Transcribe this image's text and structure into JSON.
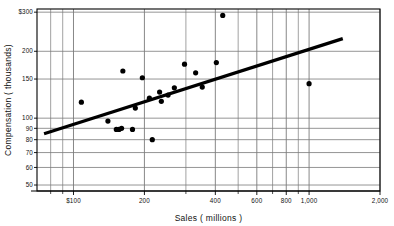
{
  "chart_data": {
    "type": "scatter",
    "title": "",
    "xlabel": "Sales ( millions )",
    "ylabel": "Compensation ( thousands)",
    "xscale": "log",
    "yscale": "log",
    "xlim": [
      70,
      2000
    ],
    "ylim": [
      47,
      310
    ],
    "grid": true,
    "legend": "none",
    "x_ticks": [
      {
        "value": 100,
        "label": "$100",
        "major": true
      },
      {
        "value": 200,
        "label": "200",
        "major": true
      },
      {
        "value": 400,
        "label": "400",
        "major": true
      },
      {
        "value": 600,
        "label": "600",
        "major": true
      },
      {
        "value": 800,
        "label": "800",
        "major": true
      },
      {
        "value": 1000,
        "label": "1,000",
        "major": true
      },
      {
        "value": 2000,
        "label": "2,000",
        "major": true
      }
    ],
    "x_minor_ticks": [
      80,
      90,
      300,
      500,
      700,
      900
    ],
    "y_ticks": [
      {
        "value": 300,
        "label": "$300"
      },
      {
        "value": 200,
        "label": "200"
      },
      {
        "value": 150,
        "label": "150"
      },
      {
        "value": 100,
        "label": "100"
      },
      {
        "value": 90,
        "label": "90"
      },
      {
        "value": 80,
        "label": "80"
      },
      {
        "value": 70,
        "label": "70"
      },
      {
        "value": 60,
        "label": "60"
      },
      {
        "value": 50,
        "label": "50"
      }
    ],
    "points": [
      {
        "x": 108,
        "y": 118
      },
      {
        "x": 162,
        "y": 163
      },
      {
        "x": 196,
        "y": 152
      },
      {
        "x": 140,
        "y": 97
      },
      {
        "x": 152,
        "y": 89
      },
      {
        "x": 156,
        "y": 89
      },
      {
        "x": 160,
        "y": 90
      },
      {
        "x": 178,
        "y": 89
      },
      {
        "x": 183,
        "y": 111
      },
      {
        "x": 216,
        "y": 80
      },
      {
        "x": 210,
        "y": 123
      },
      {
        "x": 232,
        "y": 131
      },
      {
        "x": 236,
        "y": 119
      },
      {
        "x": 252,
        "y": 127
      },
      {
        "x": 268,
        "y": 137
      },
      {
        "x": 296,
        "y": 175
      },
      {
        "x": 330,
        "y": 160
      },
      {
        "x": 352,
        "y": 138
      },
      {
        "x": 404,
        "y": 178
      },
      {
        "x": 430,
        "y": 290
      },
      {
        "x": 1000,
        "y": 143
      }
    ],
    "trendline": {
      "x_start": 75,
      "y_start": 85,
      "x_end": 1390,
      "y_end": 228,
      "style": "solid",
      "width": 3.2,
      "color": "#000000"
    },
    "colors": {
      "point": "#000000",
      "grid": "#7a7a7a",
      "axis": "#000000",
      "background": "#ffffff"
    }
  }
}
